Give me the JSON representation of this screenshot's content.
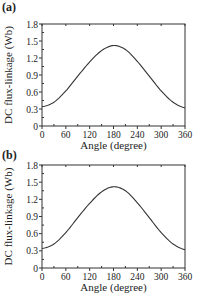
{
  "chart_data": [
    {
      "panel": "(a)",
      "type": "line",
      "title": "",
      "xlabel": "Angle (degree)",
      "ylabel": "DC flux-linkage (Wb)",
      "xlim": [
        0,
        360
      ],
      "ylim": [
        0,
        1.8
      ],
      "xticks": [
        0,
        60,
        120,
        180,
        240,
        300,
        360
      ],
      "yticks": [
        "0",
        "0.3",
        "0.6",
        "0.9",
        "1.2",
        "1.5",
        "1.8"
      ],
      "grid": false,
      "series": [
        {
          "name": "DC flux-linkage",
          "x": [
            0,
            30,
            60,
            90,
            120,
            150,
            180,
            210,
            240,
            270,
            300,
            330,
            360
          ],
          "y": [
            0.34,
            0.42,
            0.62,
            0.88,
            1.13,
            1.33,
            1.42,
            1.35,
            1.14,
            0.88,
            0.62,
            0.42,
            0.32
          ]
        }
      ]
    },
    {
      "panel": "(b)",
      "type": "line",
      "title": "",
      "xlabel": "Angle (degree)",
      "ylabel": "DC flux-linkage (Wb)",
      "xlim": [
        0,
        360
      ],
      "ylim": [
        0,
        1.8
      ],
      "xticks": [
        0,
        60,
        120,
        180,
        240,
        300,
        360
      ],
      "yticks": [
        "0",
        "0.3",
        "0.6",
        "0.9",
        "1.2",
        "1.5",
        "1.8"
      ],
      "grid": false,
      "series": [
        {
          "name": "DC flux-linkage",
          "x": [
            0,
            30,
            60,
            90,
            120,
            150,
            180,
            210,
            240,
            270,
            300,
            330,
            360
          ],
          "y": [
            0.34,
            0.42,
            0.62,
            0.88,
            1.13,
            1.33,
            1.42,
            1.35,
            1.14,
            0.88,
            0.62,
            0.42,
            0.32
          ]
        }
      ]
    }
  ],
  "panels": {
    "a": {
      "label": "(a)"
    },
    "b": {
      "label": "(b)"
    }
  },
  "colors": {
    "line": "#333333",
    "axis": "#333333"
  }
}
